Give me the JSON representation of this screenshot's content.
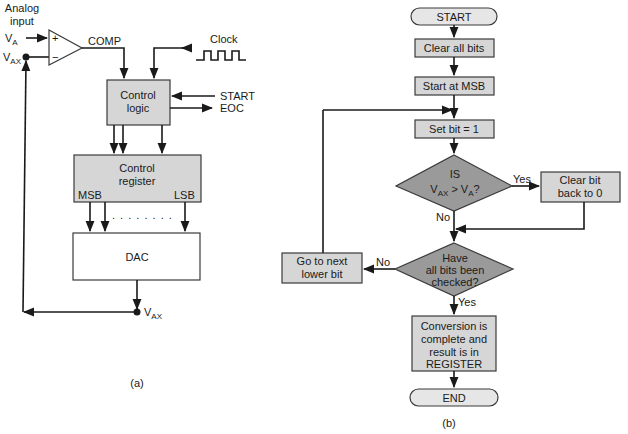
{
  "colors": {
    "process_fill": "#d6d6d6",
    "decision_fill": "#9a9a9a",
    "terminal_fill": "#e6e6e6",
    "dac_fill": "#ffffff",
    "line": "#1a1a1a"
  },
  "block_diagram": {
    "caption": "(a)",
    "analog_input_label_line1": "Analog",
    "analog_input_label_line2": "input",
    "va_label": "V",
    "va_sub": "A",
    "vax_label": "V",
    "vax_sub": "AX",
    "comparator_plus": "+",
    "comparator_minus": "−",
    "comp_label": "COMP",
    "clock_label": "Clock",
    "control_logic_line1": "Control",
    "control_logic_line2": "logic",
    "start_label": "START",
    "eoc_label": "EOC",
    "control_register_line1": "Control",
    "control_register_line2": "register",
    "msb_label": "MSB",
    "lsb_label": "LSB",
    "ellipsis": ". . . . . . . .",
    "dac_label": "DAC",
    "vax_out_label": "V",
    "vax_out_sub": "AX"
  },
  "flowchart": {
    "caption": "(b)",
    "start": "START",
    "clear_all_bits": "Clear all bits",
    "start_at_msb": "Start at MSB",
    "set_bit": "Set bit = 1",
    "decision1_line1": "IS",
    "decision1_v1": "V",
    "decision1_v1_sub": "AX",
    "decision1_op": " > V",
    "decision1_v2_sub": "A",
    "decision1_q": "?",
    "yes1": "Yes",
    "no1": "No",
    "clear_bit_line1": "Clear bit",
    "clear_bit_line2": "back to 0",
    "decision2_line1": "Have",
    "decision2_line2": "all bits been",
    "decision2_line3": "checked?",
    "no2": "No",
    "yes2": "Yes",
    "next_bit_line1": "Go to next",
    "next_bit_line2": "lower bit",
    "result_line1": "Conversion is",
    "result_line2": "complete and",
    "result_line3": "result is in",
    "result_line4": "REGISTER",
    "end": "END"
  }
}
